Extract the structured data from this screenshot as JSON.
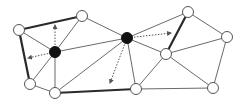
{
  "diagram": {
    "type": "graph",
    "colors": {
      "edge": "#6a6a6a",
      "thick_edge": "#2a2a2a",
      "node_fill_open": "#ffffff",
      "node_fill_solid": "#111111",
      "node_stroke": "#555555",
      "arrow": "#555555"
    },
    "nodes": [
      {
        "id": "A",
        "x": 19,
        "y": 30,
        "kind": "open"
      },
      {
        "id": "B",
        "x": 82,
        "y": 16,
        "kind": "open"
      },
      {
        "id": "C",
        "x": 30,
        "y": 84,
        "kind": "open"
      },
      {
        "id": "D",
        "x": 55,
        "y": 93,
        "kind": "open"
      },
      {
        "id": "E",
        "x": 55,
        "y": 52,
        "kind": "solid"
      },
      {
        "id": "F",
        "x": 127,
        "y": 38,
        "kind": "solid"
      },
      {
        "id": "G",
        "x": 188,
        "y": 12,
        "kind": "open"
      },
      {
        "id": "H",
        "x": 166,
        "y": 54,
        "kind": "open"
      },
      {
        "id": "I",
        "x": 227,
        "y": 37,
        "kind": "open"
      },
      {
        "id": "J",
        "x": 136,
        "y": 89,
        "kind": "open"
      },
      {
        "id": "K",
        "x": 213,
        "y": 88,
        "kind": "open"
      }
    ],
    "edges": [
      {
        "from": "A",
        "to": "B",
        "thick": true
      },
      {
        "from": "A",
        "to": "C",
        "thick": true
      },
      {
        "from": "A",
        "to": "E",
        "thick": false
      },
      {
        "from": "B",
        "to": "E",
        "thick": false
      },
      {
        "from": "B",
        "to": "F",
        "thick": false
      },
      {
        "from": "C",
        "to": "E",
        "thick": false
      },
      {
        "from": "C",
        "to": "D",
        "thick": false
      },
      {
        "from": "D",
        "to": "E",
        "thick": false
      },
      {
        "from": "D",
        "to": "F",
        "thick": false
      },
      {
        "from": "D",
        "to": "J",
        "thick": true
      },
      {
        "from": "E",
        "to": "F",
        "thick": false
      },
      {
        "from": "F",
        "to": "G",
        "thick": false
      },
      {
        "from": "F",
        "to": "H",
        "thick": false
      },
      {
        "from": "F",
        "to": "J",
        "thick": false
      },
      {
        "from": "G",
        "to": "H",
        "thick": true
      },
      {
        "from": "G",
        "to": "I",
        "thick": false
      },
      {
        "from": "H",
        "to": "I",
        "thick": false
      },
      {
        "from": "H",
        "to": "J",
        "thick": false
      },
      {
        "from": "H",
        "to": "K",
        "thick": false
      },
      {
        "from": "I",
        "to": "K",
        "thick": false
      },
      {
        "from": "J",
        "to": "K",
        "thick": false
      }
    ],
    "arrows": [
      {
        "from_node": "E",
        "x2": 55,
        "y2": 25
      },
      {
        "from_node": "E",
        "x2": 28,
        "y2": 58
      },
      {
        "from_node": "F",
        "x2": 171,
        "y2": 33
      },
      {
        "from_node": "F",
        "x2": 110,
        "y2": 83
      }
    ]
  }
}
